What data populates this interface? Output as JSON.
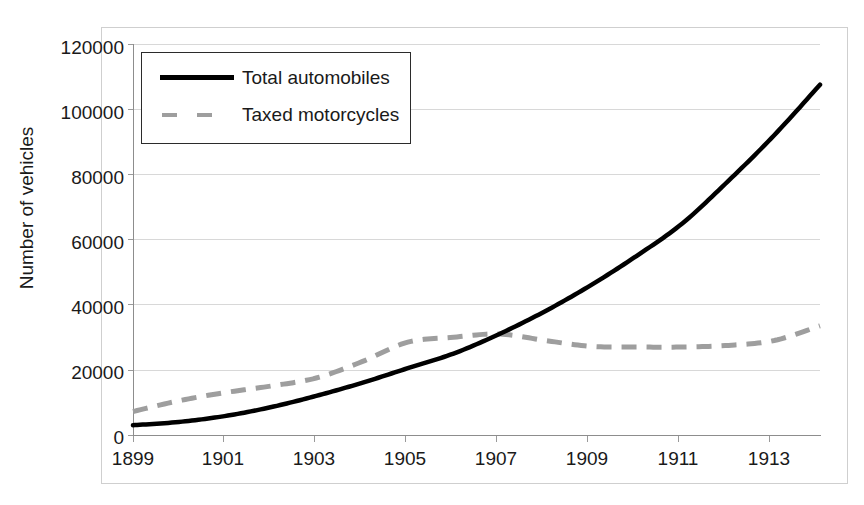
{
  "chart_data": {
    "type": "line",
    "title": "",
    "xlabel": "",
    "ylabel": "Number of vehicles",
    "xlim": [
      1899,
      1914
    ],
    "ylim": [
      0,
      120000
    ],
    "grid": true,
    "legend_position": "top-left",
    "x_tick_labels": [
      "1899",
      "1901",
      "1903",
      "1905",
      "1907",
      "1909",
      "1911",
      "1913"
    ],
    "x_tick_values": [
      1899,
      1901,
      1903,
      1905,
      1907,
      1909,
      1911,
      1913
    ],
    "y_tick_labels": [
      "0",
      "20000",
      "40000",
      "60000",
      "80000",
      "100000",
      "120000"
    ],
    "y_tick_values": [
      0,
      20000,
      40000,
      60000,
      80000,
      100000,
      120000
    ],
    "x": [
      1899,
      1900,
      1901,
      1902,
      1903,
      1904,
      1905,
      1906,
      1907,
      1908,
      1909,
      1910,
      1911,
      1912,
      1913,
      1914
    ],
    "series": [
      {
        "name": "Total automobiles",
        "style": "solid",
        "color": "#000000",
        "values": [
          3000,
          4000,
          5800,
          8500,
          12000,
          16000,
          20500,
          25000,
          31000,
          38000,
          46000,
          55000,
          65000,
          78000,
          92000,
          107500
        ]
      },
      {
        "name": "Taxed motorcycles",
        "style": "dashed",
        "color": "#9e9e9e",
        "values": [
          7200,
          10500,
          13000,
          15000,
          17500,
          22500,
          28500,
          30000,
          31000,
          29000,
          27200,
          27000,
          27000,
          27500,
          29000,
          33500
        ]
      }
    ]
  },
  "legend": {
    "items": [
      {
        "label": "Total automobiles",
        "swatch": "solid-line-swatch"
      },
      {
        "label": "Taxed motorcycles",
        "swatch": "dashed-line-swatch"
      }
    ]
  },
  "axes": {
    "y_title": "Number of vehicles",
    "y_labels": [
      "120000",
      "100000",
      "80000",
      "60000",
      "40000",
      "20000",
      "0"
    ],
    "x_labels": [
      "1899",
      "1901",
      "1903",
      "1905",
      "1907",
      "1909",
      "1911",
      "1913"
    ]
  },
  "colors": {
    "series_solid": "#000000",
    "series_dashed": "#9e9e9e",
    "gridline": "#d8d8d8",
    "axis": "#8d8d8d",
    "frame": "#cfcfcf",
    "text": "#1a1a1a"
  }
}
